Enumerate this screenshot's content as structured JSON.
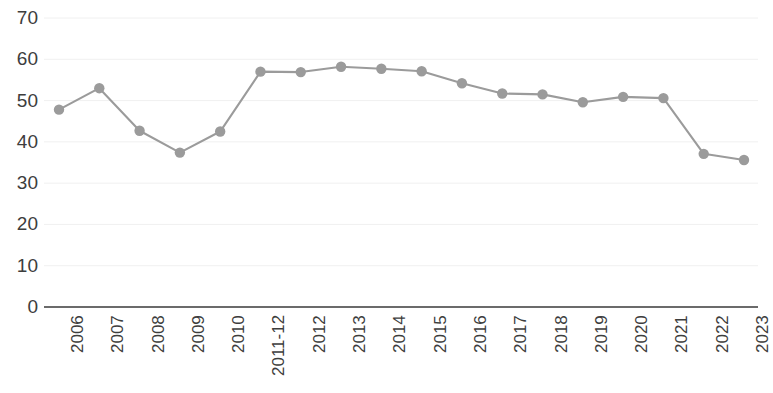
{
  "chart_data": {
    "type": "line",
    "title": "",
    "subtitle": "",
    "xlabel": "",
    "ylabel": "",
    "categories": [
      "2006",
      "2007",
      "2008",
      "2009",
      "2010",
      "2011-12",
      "2012",
      "2013",
      "2014",
      "2015",
      "2016",
      "2017",
      "2018",
      "2019",
      "2020",
      "2021",
      "2022",
      "2023"
    ],
    "values": [
      47.8,
      53.0,
      42.7,
      37.4,
      42.5,
      57.0,
      56.9,
      58.2,
      57.7,
      57.1,
      54.2,
      51.7,
      51.5,
      49.6,
      50.9,
      50.6,
      37.1,
      35.6
    ],
    "series": [
      {
        "name": "Series 1",
        "values": [
          47.8,
          53.0,
          42.7,
          37.4,
          42.5,
          57.0,
          56.9,
          58.2,
          57.7,
          57.1,
          54.2,
          51.7,
          51.5,
          49.6,
          50.9,
          50.6,
          37.1,
          35.6
        ],
        "color": "#9b9b9b",
        "marker": "circle"
      }
    ],
    "y_ticks": [
      0,
      10,
      20,
      30,
      40,
      50,
      60,
      70
    ],
    "ylim": [
      0,
      70
    ],
    "grid": true,
    "grid_axis": "y",
    "grid_color": "#f0f0f0",
    "legend": false,
    "legend_position": "none",
    "line_color": "#9b9b9b",
    "marker_color": "#9b9b9b",
    "axis_color": "#6b6b6b",
    "tick_label_color": "#3d3d3d",
    "x_tick_rotation": -90
  },
  "axes": {
    "y_tick_labels": [
      "70",
      "60",
      "50",
      "40",
      "30",
      "20",
      "10",
      "0"
    ],
    "x_tick_labels": [
      "2006",
      "2007",
      "2008",
      "2009",
      "2010",
      "2011-12",
      "2012",
      "2013",
      "2014",
      "2015",
      "2016",
      "2017",
      "2018",
      "2019",
      "2020",
      "2021",
      "2022",
      "2023"
    ]
  }
}
